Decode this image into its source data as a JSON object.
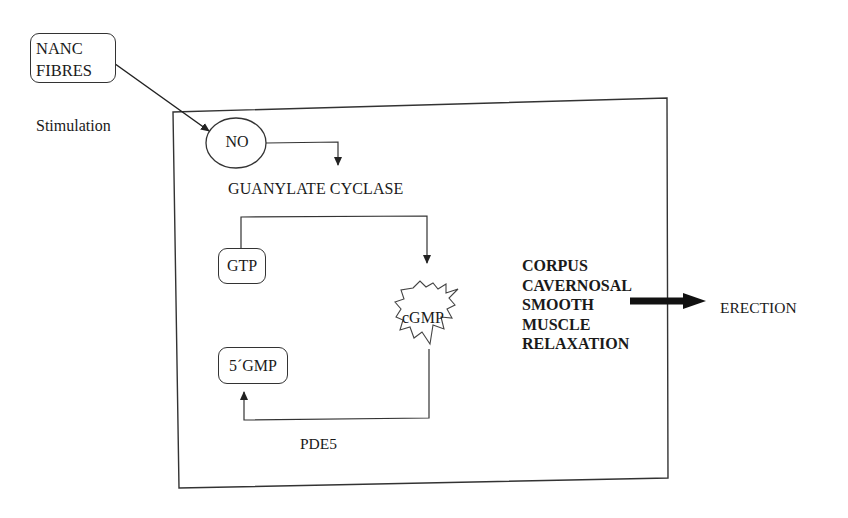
{
  "diagram": {
    "nodes": {
      "nanc_fibres": {
        "line1": "NANC",
        "line2": "FIBRES"
      },
      "stimulation": "Stimulation",
      "no": "NO",
      "guanylate_cyclase": "GUANYLATE CYCLASE",
      "gtp": "GTP",
      "cgmp": "cGMP",
      "gmp5": "5´GMP",
      "pde5": "PDE5",
      "relaxation": [
        "CORPUS",
        "CAVERNOSAL",
        "SMOOTH",
        "MUSCLE",
        "RELAXATION"
      ],
      "erection": "ERECTION"
    },
    "edges": [
      {
        "from": "NANC FIBRES",
        "to": "NO",
        "label": "Stimulation"
      },
      {
        "from": "NO",
        "to": "GUANYLATE CYCLASE"
      },
      {
        "from": "GTP",
        "to": "cGMP",
        "via": "GUANYLATE CYCLASE"
      },
      {
        "from": "cGMP",
        "to": "5´GMP",
        "label": "PDE5"
      },
      {
        "from": "CORPUS CAVERNOSAL SMOOTH MUSCLE RELAXATION",
        "to": "ERECTION"
      }
    ],
    "colors": {
      "line": "#333333",
      "background": "#ffffff",
      "text": "#1a1a1a"
    }
  }
}
